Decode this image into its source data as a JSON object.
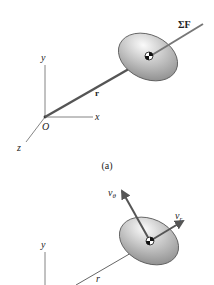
{
  "figure_a": {
    "caption": "(a)",
    "axes": {
      "y_label": "y",
      "x_label": "x",
      "z_label": "z",
      "origin_label": "O"
    },
    "position_vector_label": "r",
    "force_label": "ΣF"
  },
  "figure_b": {
    "axes": {
      "y_label": "y"
    },
    "position_label": "r",
    "v_theta_label": "v",
    "v_theta_sub": "θ",
    "v_r_label": "v",
    "v_r_sub": "r"
  },
  "colors": {
    "axis": "#555555",
    "vector": "#5a5a5a",
    "body_fill_light": "#f4f4f4",
    "body_fill_dark": "#8c8c8c"
  }
}
